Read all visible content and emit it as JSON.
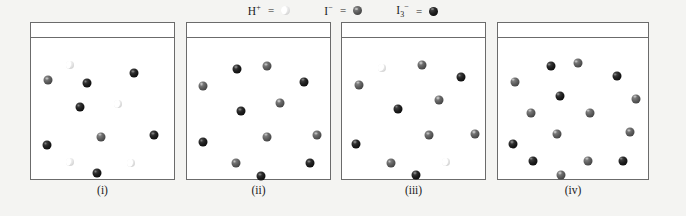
{
  "figure": {
    "background_color": "#f4f4f2",
    "panel_color": "#ffffff",
    "border_color": "#6b6b6b"
  },
  "legend": {
    "items": [
      {
        "name": "proton",
        "species": "H",
        "charge": "+",
        "sub": "",
        "equals": "=",
        "glyph": "crescent",
        "color": "#ededed"
      },
      {
        "name": "iodide",
        "species": "I",
        "charge": "−",
        "sub": "",
        "equals": "=",
        "glyph": "sphere-gray",
        "color": "#5f5f5f"
      },
      {
        "name": "triiodide",
        "species": "I",
        "charge": "−",
        "sub": "3",
        "equals": "=",
        "glyph": "sphere-dark",
        "color": "#1f1f1f"
      }
    ]
  },
  "chart_data": {
    "type": "diagram",
    "xlabel": "",
    "ylabel": "",
    "legend_position": "top-center",
    "species_key": {
      "H+": "light crescent",
      "I-": "medium gray sphere",
      "I3-": "dark black sphere"
    },
    "panels": [
      {
        "label": "(i)",
        "counts": {
          "H+": 4,
          "I-": 4,
          "I3-": 4
        },
        "particles": [
          {
            "type": "I3-",
            "x": 39,
            "y": 32
          },
          {
            "type": "H+",
            "x": 27,
            "y": 19
          },
          {
            "type": "I-",
            "x": 12,
            "y": 30
          },
          {
            "type": "I3-",
            "x": 72,
            "y": 25
          },
          {
            "type": "I3-",
            "x": 34,
            "y": 49
          },
          {
            "type": "H+",
            "x": 61,
            "y": 47
          },
          {
            "type": "I-",
            "x": 49,
            "y": 70
          },
          {
            "type": "I3-",
            "x": 86,
            "y": 69
          },
          {
            "type": "I3-",
            "x": 11,
            "y": 76
          },
          {
            "type": "H+",
            "x": 27,
            "y": 88
          },
          {
            "type": "H+",
            "x": 70,
            "y": 89
          },
          {
            "type": "I3-",
            "x": 46,
            "y": 96
          }
        ]
      },
      {
        "label": "(ii)",
        "counts": {
          "H+": 0,
          "I-": 6,
          "I3-": 6
        },
        "particles": [
          {
            "type": "I3-",
            "x": 35,
            "y": 22
          },
          {
            "type": "I-",
            "x": 56,
            "y": 20
          },
          {
            "type": "I-",
            "x": 11,
            "y": 34
          },
          {
            "type": "I3-",
            "x": 82,
            "y": 31
          },
          {
            "type": "I3-",
            "x": 38,
            "y": 52
          },
          {
            "type": "I-",
            "x": 65,
            "y": 46
          },
          {
            "type": "I-",
            "x": 56,
            "y": 70
          },
          {
            "type": "I3-",
            "x": 11,
            "y": 74
          },
          {
            "type": "I-",
            "x": 91,
            "y": 69
          },
          {
            "type": "I-",
            "x": 34,
            "y": 89
          },
          {
            "type": "I3-",
            "x": 86,
            "y": 89
          },
          {
            "type": "I3-",
            "x": 52,
            "y": 98
          }
        ]
      },
      {
        "label": "(iii)",
        "counts": {
          "H+": 2,
          "I-": 6,
          "I3-": 5
        },
        "particles": [
          {
            "type": "H+",
            "x": 28,
            "y": 21
          },
          {
            "type": "I-",
            "x": 56,
            "y": 19
          },
          {
            "type": "I-",
            "x": 12,
            "y": 33
          },
          {
            "type": "I3-",
            "x": 83,
            "y": 28
          },
          {
            "type": "I3-",
            "x": 39,
            "y": 50
          },
          {
            "type": "I-",
            "x": 68,
            "y": 44
          },
          {
            "type": "I-",
            "x": 61,
            "y": 69
          },
          {
            "type": "I3-",
            "x": 10,
            "y": 75
          },
          {
            "type": "I-",
            "x": 93,
            "y": 68
          },
          {
            "type": "I-",
            "x": 34,
            "y": 89
          },
          {
            "type": "H+",
            "x": 73,
            "y": 88
          },
          {
            "type": "I3-",
            "x": 52,
            "y": 97
          }
        ]
      },
      {
        "label": "(iv)",
        "counts": {
          "H+": 0,
          "I-": 9,
          "I3-": 7
        },
        "particles": [
          {
            "type": "I3-",
            "x": 35,
            "y": 20
          },
          {
            "type": "I-",
            "x": 53,
            "y": 18
          },
          {
            "type": "I-",
            "x": 11,
            "y": 31
          },
          {
            "type": "I3-",
            "x": 79,
            "y": 27
          },
          {
            "type": "I3-",
            "x": 41,
            "y": 41
          },
          {
            "type": "I-",
            "x": 92,
            "y": 43
          },
          {
            "type": "I-",
            "x": 22,
            "y": 53
          },
          {
            "type": "I-",
            "x": 61,
            "y": 53
          },
          {
            "type": "I-",
            "x": 39,
            "y": 68
          },
          {
            "type": "I-",
            "x": 88,
            "y": 67
          },
          {
            "type": "I3-",
            "x": 10,
            "y": 75
          },
          {
            "type": "I3-",
            "x": 23,
            "y": 87
          },
          {
            "type": "I-",
            "x": 60,
            "y": 87
          },
          {
            "type": "I3-",
            "x": 83,
            "y": 87
          },
          {
            "type": "I-",
            "x": 42,
            "y": 97
          }
        ]
      }
    ]
  },
  "panels_geometry": {
    "boxes": [
      {
        "left": 30,
        "top": 22,
        "width": 145,
        "height": 158
      },
      {
        "left": 186,
        "top": 22,
        "width": 145,
        "height": 158
      },
      {
        "left": 341,
        "top": 22,
        "width": 145,
        "height": 158
      },
      {
        "left": 497,
        "top": 22,
        "width": 152,
        "height": 158
      }
    ]
  }
}
